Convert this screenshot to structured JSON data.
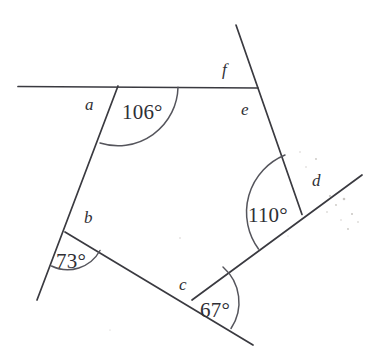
{
  "figure": {
    "type": "geometry-diagram",
    "width": 368,
    "height": 355,
    "background_color": "#ffffff",
    "line_color": "#3a3a40",
    "arc_color": "#55555c",
    "text_color": "#2f2f35"
  },
  "angle_measures": [
    {
      "id": "angle-106",
      "value": "106°",
      "x": 122,
      "y": 102,
      "vertex": [
        118,
        86
      ]
    },
    {
      "id": "angle-110",
      "value": "110°",
      "x": 248,
      "y": 205,
      "vertex": [
        302,
        214
      ]
    },
    {
      "id": "angle-73",
      "value": "73°",
      "x": 56,
      "y": 251,
      "vertex": [
        65,
        232
      ]
    },
    {
      "id": "angle-67",
      "value": "67°",
      "x": 200,
      "y": 300,
      "vertex": [
        192,
        300
      ]
    }
  ],
  "angle_labels": [
    {
      "id": "label-a",
      "text": "a",
      "x": 85,
      "y": 96
    },
    {
      "id": "label-b",
      "text": "b",
      "x": 84,
      "y": 209
    },
    {
      "id": "label-c",
      "text": "c",
      "x": 179,
      "y": 276
    },
    {
      "id": "label-d",
      "text": "d",
      "x": 312,
      "y": 172
    },
    {
      "id": "label-e",
      "text": "e",
      "x": 241,
      "y": 101
    },
    {
      "id": "label-f",
      "text": "f",
      "x": 222,
      "y": 61
    }
  ],
  "segments": [
    {
      "id": "top-horizontal",
      "from": [
        18,
        86
      ],
      "to": [
        258,
        88
      ]
    },
    {
      "id": "upper-left-side",
      "from": [
        118,
        86
      ],
      "to": [
        65,
        232
      ]
    },
    {
      "id": "lower-left-ray",
      "from": [
        65,
        232
      ],
      "to": [
        37,
        300
      ]
    },
    {
      "id": "bottom-left-side",
      "from": [
        65,
        232
      ],
      "to": [
        192,
        300
      ]
    },
    {
      "id": "bottom-right-ray",
      "from": [
        192,
        300
      ],
      "to": [
        253,
        345
      ]
    },
    {
      "id": "right-diagonal",
      "from": [
        192,
        300
      ],
      "to": [
        362,
        175
      ]
    },
    {
      "id": "right-side",
      "from": [
        236,
        25
      ],
      "to": [
        302,
        214
      ]
    }
  ]
}
